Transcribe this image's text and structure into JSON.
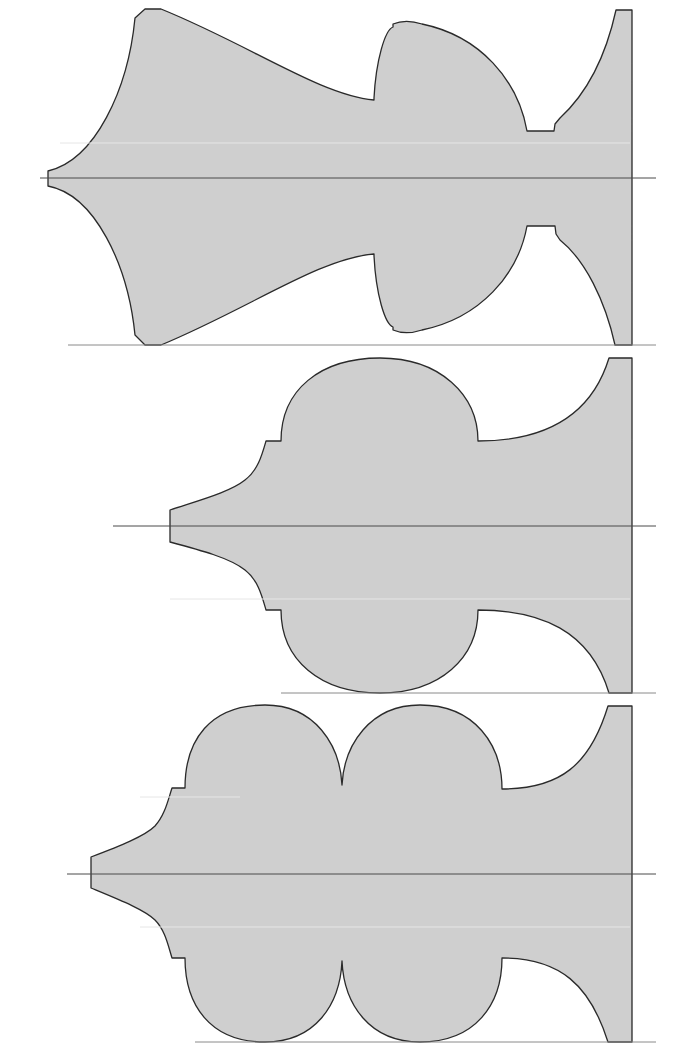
{
  "diagram": {
    "type": "lathe-turning profile templates",
    "colors": {
      "fill": "#cfcfcf",
      "outline": "#2a2a2a",
      "centerline": "#4a4a4a",
      "baseline": "#8a8a8a",
      "background": "#ffffff"
    },
    "profiles": [
      {
        "name": "profile-1",
        "description": "Flared cove with tapered neck, bulbous bead, fillet and flared foot",
        "centerline_y": 178,
        "base_y": 345
      },
      {
        "name": "profile-2",
        "description": "Tapered tip, single round bead, cove to base",
        "centerline_y": 526,
        "base_y": 693
      },
      {
        "name": "profile-3",
        "description": "Tapered tip, double round beads, cove to base",
        "centerline_y": 874,
        "base_y": 1042
      }
    ]
  }
}
